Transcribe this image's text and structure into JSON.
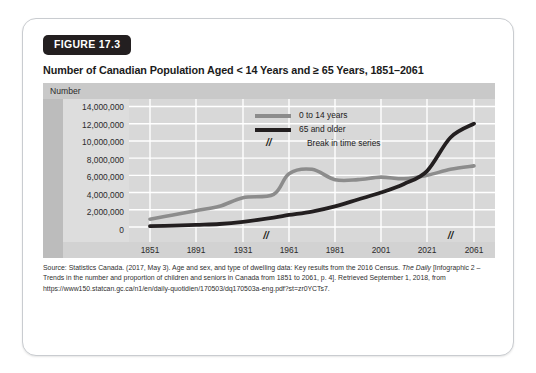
{
  "figure": {
    "badge": "FIGURE 17.3",
    "title": "Number of Canadian Population Aged < 14 Years and ≥ 65 Years, 1851–2061",
    "axis_header": "Number"
  },
  "legend": {
    "items": [
      {
        "label": "0 to 14 years",
        "color": "#8c8c8c",
        "marker": "line-gray"
      },
      {
        "label": "65 and older",
        "color": "#231f20",
        "marker": "line-black"
      },
      {
        "label": "Break in time series",
        "color": "#231f20",
        "marker": "double-slash",
        "glyph": "//"
      }
    ]
  },
  "source": {
    "line1": "Source: Statistics Canada. (2017, May 3). Age and sex, and type of dwelling data: Key results from the 2016 Census.",
    "italic": "The Daily",
    "line2_rest": " [Infographic 2 – Trends in the number and proportion of children and seniors in Canada from 1851 to 2061,",
    "line3": "p. 4]. Retrieved September 1, 2018, from https://www150.statcan.gc.ca/n1/en/daily-quotidien/170503/dq170503a-eng",
    "line4": ".pdf?st=zr0YCTs7."
  },
  "chart_data": {
    "type": "line",
    "title": "Number of Canadian Population Aged < 14 Years and ≥ 65 Years, 1851–2061",
    "xlabel": "",
    "ylabel": "Number",
    "ylim": [
      0,
      14000000
    ],
    "ytick_labels": [
      "14,000,000",
      "12,000,000",
      "10,000,000",
      "8,000,000",
      "6,000,000",
      "4,000,000",
      "2,000,000",
      "0"
    ],
    "ytick_values": [
      14000000,
      12000000,
      10000000,
      8000000,
      6000000,
      4000000,
      2000000,
      0
    ],
    "xtick_labels": [
      "1851",
      "1891",
      "1931",
      "1961",
      "1981",
      "2001",
      "2021",
      "2061"
    ],
    "xtick_values": [
      1851,
      1891,
      1931,
      1961,
      1981,
      2001,
      2021,
      2061
    ],
    "grid": true,
    "legend_position": "upper-left-inside",
    "break_markers": [
      {
        "between": "1931-1961",
        "glyph": "//"
      },
      {
        "between": "2021-2061",
        "glyph": "//"
      }
    ],
    "series": [
      {
        "name": "0 to 14 years",
        "color": "#8c8c8c",
        "x": [
          1851,
          1871,
          1891,
          1911,
          1931,
          1951,
          1961,
          1971,
          1981,
          1991,
          2001,
          2011,
          2021,
          2041,
          2061
        ],
        "values": [
          900000,
          1400000,
          1900000,
          2400000,
          3400000,
          3800000,
          6200000,
          6700000,
          5500000,
          5500000,
          5800000,
          5600000,
          6000000,
          6700000,
          7100000
        ]
      },
      {
        "name": "65 and older",
        "color": "#231f20",
        "x": [
          1851,
          1871,
          1891,
          1911,
          1931,
          1951,
          1961,
          1971,
          1981,
          1991,
          2001,
          2011,
          2021,
          2041,
          2061
        ],
        "values": [
          100000,
          150000,
          250000,
          350000,
          600000,
          1100000,
          1400000,
          1800000,
          2400000,
          3200000,
          4000000,
          5000000,
          6500000,
          10400000,
          12000000
        ]
      }
    ]
  }
}
